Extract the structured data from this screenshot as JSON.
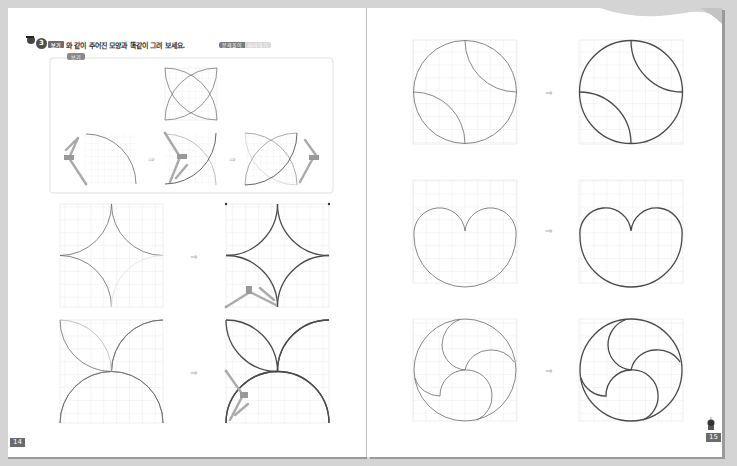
{
  "left_page": {
    "problem": {
      "number": "3",
      "badge": "보기",
      "instruction": "와 같이 주어진 모양과 똑같이 그려 보세요.",
      "tag": [
        "문제풀이",
        "따라하기"
      ]
    },
    "example_box": {
      "label": "보기",
      "steps": [
        "target-shape",
        "step-1",
        "step-2",
        "step-3"
      ],
      "arrow": "⇒"
    },
    "exercises": [
      {
        "shape": "astroid-star",
        "arrow": "⇒"
      },
      {
        "shape": "four-petal-flower",
        "arrow": "⇒"
      }
    ],
    "page_number": "14"
  },
  "right_page": {
    "exercises": [
      {
        "shape": "circle-with-two-arcs",
        "arrow": "⇒"
      },
      {
        "shape": "heart-cardioid",
        "arrow": "⇒"
      },
      {
        "shape": "triple-swirl-circle",
        "arrow": "⇒"
      }
    ],
    "page_number": "15"
  },
  "colors": {
    "grid": "#e2e2e2",
    "stroke_light": "#6a6a6a",
    "stroke_bold": "#4a4a4a",
    "arrow": "#b5b5b5",
    "box_border": "#d8d8d8"
  }
}
